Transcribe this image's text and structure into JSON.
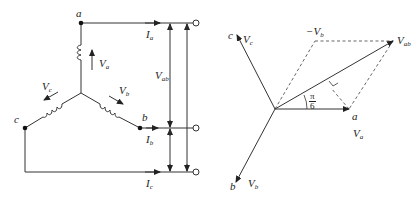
{
  "circuit": {
    "nodes": {
      "a": "a",
      "b": "b",
      "c": "c"
    },
    "voltages": {
      "Va": {
        "main": "V",
        "sub": "a"
      },
      "Vb": {
        "main": "V",
        "sub": "b"
      },
      "Vc": {
        "main": "V",
        "sub": "c"
      },
      "Vab": {
        "main": "V",
        "sub": "ab"
      }
    },
    "currents": {
      "Ia": {
        "main": "I",
        "sub": "a"
      },
      "Ib": {
        "main": "I",
        "sub": "b"
      },
      "Ic": {
        "main": "I",
        "sub": "c"
      }
    }
  },
  "phasor": {
    "nodes": {
      "a": "a",
      "b": "b",
      "c": "c"
    },
    "labels": {
      "Va": {
        "main": "V",
        "sub": "a"
      },
      "Vb": {
        "main": "V",
        "sub": "b"
      },
      "Vc": {
        "main": "V",
        "sub": "c"
      },
      "Vab": {
        "main": "V",
        "sub": "ab"
      },
      "negVb": {
        "main": "−V",
        "sub": "b"
      }
    },
    "angle": {
      "num": "π",
      "den": "6"
    }
  },
  "colors": {
    "line": "#333333",
    "dashed": "#555555"
  }
}
